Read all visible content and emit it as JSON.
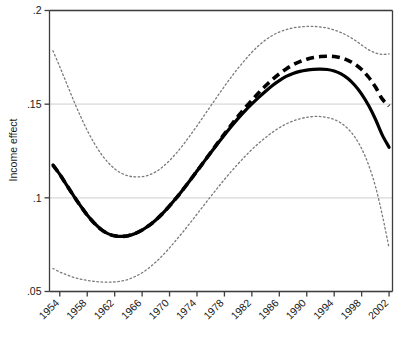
{
  "chart_data": {
    "type": "line",
    "title": "",
    "xlabel": "",
    "ylabel": "Income effect",
    "xlim": [
      1952.5,
      2002.5
    ],
    "ylim": [
      0.05,
      0.2
    ],
    "grid": true,
    "gridlines_y": [
      0.05,
      0.1,
      0.15,
      0.2
    ],
    "legend": "none",
    "xticks": [
      1954,
      1958,
      1962,
      1966,
      1970,
      1974,
      1978,
      1982,
      1986,
      1990,
      1994,
      1998,
      2002
    ],
    "xtick_labels": [
      "1954",
      "1958",
      "1962",
      "1966",
      "1970",
      "1974",
      "1978",
      "1982",
      "1986",
      "1990",
      "1994",
      "1998",
      "2002"
    ],
    "yticks": [
      0.05,
      0.1,
      0.15,
      0.2
    ],
    "ytick_labels": [
      ".05",
      ".1",
      ".15",
      ".2"
    ],
    "x": [
      1953,
      1954,
      1955,
      1956,
      1957,
      1958,
      1959,
      1960,
      1961,
      1962,
      1963,
      1964,
      1965,
      1966,
      1967,
      1968,
      1969,
      1970,
      1971,
      1972,
      1973,
      1974,
      1975,
      1976,
      1977,
      1978,
      1979,
      1980,
      1981,
      1982,
      1983,
      1984,
      1985,
      1986,
      1987,
      1988,
      1989,
      1990,
      1991,
      1992,
      1993,
      1994,
      1995,
      1996,
      1997,
      1998,
      1999,
      2000,
      2001,
      2002
    ],
    "series": [
      {
        "name": "Income effect (solid estimate)",
        "style": "solid",
        "color": "#000000",
        "width": 3.2,
        "values": [
          0.1175,
          0.1125,
          0.1068,
          0.1012,
          0.0958,
          0.0908,
          0.0866,
          0.0832,
          0.0809,
          0.0797,
          0.0794,
          0.0798,
          0.081,
          0.0828,
          0.0852,
          0.0882,
          0.0917,
          0.0957,
          0.1,
          0.1046,
          0.1094,
          0.1143,
          0.1192,
          0.1241,
          0.1289,
          0.1336,
          0.1381,
          0.1424,
          0.1464,
          0.1501,
          0.1536,
          0.1569,
          0.16,
          0.1626,
          0.1648,
          0.1664,
          0.1675,
          0.1682,
          0.1686,
          0.1687,
          0.1685,
          0.1677,
          0.1662,
          0.1637,
          0.1601,
          0.1554,
          0.1494,
          0.1421,
          0.1336,
          0.127
        ]
      },
      {
        "name": "Income effect (dashed estimate)",
        "style": "dashed",
        "color": "#000000",
        "width": 3.6,
        "values": [
          0.1175,
          0.1125,
          0.1068,
          0.1012,
          0.0958,
          0.0908,
          0.0866,
          0.0832,
          0.0809,
          0.0797,
          0.0794,
          0.0798,
          0.081,
          0.0828,
          0.0852,
          0.0882,
          0.0917,
          0.0957,
          0.1,
          0.1046,
          0.1094,
          0.1143,
          0.1192,
          0.1242,
          0.1292,
          0.1341,
          0.1389,
          0.1436,
          0.148,
          0.1521,
          0.1561,
          0.1598,
          0.1632,
          0.1662,
          0.1688,
          0.171,
          0.1727,
          0.174,
          0.1749,
          0.1754,
          0.1756,
          0.1754,
          0.1747,
          0.1734,
          0.1714,
          0.1685,
          0.1645,
          0.1593,
          0.1528,
          0.149
        ]
      },
      {
        "name": "Upper confidence bound",
        "style": "dotted",
        "color": "#7a7a7a",
        "width": 1.3,
        "values": [
          0.1785,
          0.17,
          0.161,
          0.1521,
          0.1437,
          0.136,
          0.1293,
          0.1236,
          0.119,
          0.1155,
          0.1131,
          0.1117,
          0.1112,
          0.1113,
          0.1122,
          0.1139,
          0.1165,
          0.1199,
          0.1239,
          0.1284,
          0.1333,
          0.1384,
          0.1437,
          0.149,
          0.1543,
          0.1595,
          0.1645,
          0.1692,
          0.1736,
          0.1777,
          0.1813,
          0.1843,
          0.1867,
          0.1885,
          0.1898,
          0.1907,
          0.1912,
          0.1915,
          0.1915,
          0.1912,
          0.1906,
          0.1896,
          0.1882,
          0.1864,
          0.1842,
          0.1816,
          0.1791,
          0.1774,
          0.1766,
          0.1768
        ]
      },
      {
        "name": "Lower confidence bound",
        "style": "dotted",
        "color": "#7a7a7a",
        "width": 1.3,
        "values": [
          0.0623,
          0.0604,
          0.0589,
          0.0576,
          0.0566,
          0.0559,
          0.0554,
          0.0551,
          0.055,
          0.0551,
          0.0556,
          0.0565,
          0.058,
          0.06,
          0.0626,
          0.0657,
          0.0693,
          0.0733,
          0.0776,
          0.082,
          0.0866,
          0.0913,
          0.096,
          0.1007,
          0.1053,
          0.1098,
          0.1141,
          0.1182,
          0.1221,
          0.1258,
          0.1292,
          0.1322,
          0.135,
          0.1374,
          0.1394,
          0.141,
          0.1422,
          0.143,
          0.1434,
          0.1434,
          0.1429,
          0.1418,
          0.1399,
          0.1369,
          0.1325,
          0.1263,
          0.1177,
          0.1063,
          0.091,
          0.0733
        ]
      }
    ]
  },
  "colors": {
    "axis": "#3d3d3d",
    "gridline": "#e3e3e3",
    "estimate": "#000000",
    "confidence": "#7a7a7a",
    "background": "#ffffff"
  }
}
